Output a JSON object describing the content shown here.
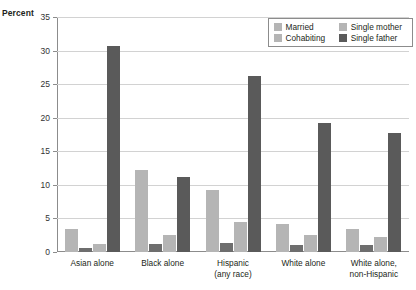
{
  "axis": {
    "y_title": "Percent",
    "y_ticks": [
      "0",
      "5",
      "10",
      "15",
      "20",
      "25",
      "30",
      "35"
    ]
  },
  "legend": {
    "items": [
      {
        "label": "Married",
        "color": "#b5b5b5"
      },
      {
        "label": "Single mother",
        "color": "#b5b5b5"
      },
      {
        "label": "Cohabiting",
        "color": "#b5b5b5"
      },
      {
        "label": "Single father",
        "color": "#5a5a5a"
      }
    ]
  },
  "chart_data": {
    "type": "bar",
    "title": "",
    "xlabel": "",
    "ylabel": "Percent",
    "ylim": [
      0,
      35
    ],
    "grid": true,
    "legend_position": "top-right",
    "categories": [
      "Asian alone",
      "Black alone",
      "Hispanic (any race)",
      "White alone",
      "White alone, non-Hispanic"
    ],
    "category_lines": [
      [
        "Asian alone",
        ""
      ],
      [
        "Black alone",
        ""
      ],
      [
        "Hispanic",
        "(any race)"
      ],
      [
        "White alone",
        ""
      ],
      [
        "White alone,",
        "non-Hispanic"
      ]
    ],
    "series": [
      {
        "name": "Married",
        "color": "#b5b5b5",
        "values": [
          3.5,
          12.2,
          9.2,
          4.2,
          3.5
        ]
      },
      {
        "name": "Cohabiting",
        "color": "#6e6e6e",
        "values": [
          0.6,
          1.2,
          1.3,
          1.0,
          1.0
        ]
      },
      {
        "name": "Single mother",
        "color": "#b5b5b5",
        "values": [
          1.2,
          2.5,
          4.4,
          2.5,
          2.2
        ]
      },
      {
        "name": "Single father",
        "color": "#5a5a5a",
        "values": [
          30.7,
          11.1,
          26.2,
          19.2,
          17.8
        ]
      }
    ]
  }
}
